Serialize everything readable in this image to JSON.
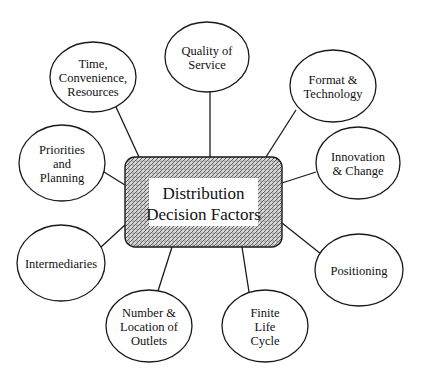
{
  "diagram": {
    "type": "hub-and-spoke",
    "center": {
      "label_lines": [
        "Distribution",
        "Decision Factors"
      ],
      "x": 125,
      "y": 157,
      "width": 157,
      "height": 90,
      "fill_pattern": "stippled-gray"
    },
    "nodes": [
      {
        "id": "time-convenience-resources",
        "label_lines": [
          "Time,",
          "Convenience,",
          "Resources"
        ],
        "cx": 93,
        "cy": 77,
        "rx": 43,
        "ry": 35,
        "line": [
          116,
          107,
          139,
          157
        ]
      },
      {
        "id": "quality-of-service",
        "label_lines": [
          "Quality of",
          "Service"
        ],
        "cx": 207,
        "cy": 57,
        "rx": 42,
        "ry": 35,
        "line": [
          210,
          92,
          210,
          157
        ]
      },
      {
        "id": "format-technology",
        "label_lines": [
          "Format &",
          "Technology"
        ],
        "cx": 333,
        "cy": 86,
        "rx": 43,
        "ry": 36,
        "line": [
          296,
          110,
          266,
          157
        ]
      },
      {
        "id": "innovation-change",
        "label_lines": [
          "Innovation",
          "& Change"
        ],
        "cx": 358,
        "cy": 163,
        "rx": 42,
        "ry": 36,
        "line": [
          316,
          172,
          282,
          183
        ]
      },
      {
        "id": "priorities-planning",
        "label_lines": [
          "Priorities",
          "and",
          "Planning"
        ],
        "cx": 62,
        "cy": 163,
        "rx": 43,
        "ry": 38,
        "line": [
          104,
          172,
          125,
          185
        ]
      },
      {
        "id": "intermediaries",
        "label_lines": [
          "Intermediaries"
        ],
        "cx": 61,
        "cy": 263,
        "rx": 44,
        "ry": 38,
        "line": [
          101,
          247,
          125,
          225
        ]
      },
      {
        "id": "positioning",
        "label_lines": [
          "Positioning"
        ],
        "cx": 359,
        "cy": 270,
        "rx": 44,
        "ry": 36,
        "line": [
          321,
          254,
          282,
          223
        ]
      },
      {
        "id": "number-location-outlets",
        "label_lines": [
          "Number &",
          "Location of",
          "Outlets"
        ],
        "cx": 149,
        "cy": 326,
        "rx": 43,
        "ry": 36,
        "line": [
          158,
          291,
          172,
          247
        ]
      },
      {
        "id": "finite-life-cycle",
        "label_lines": [
          "Finite",
          "Life",
          "Cycle"
        ],
        "cx": 265,
        "cy": 326,
        "rx": 43,
        "ry": 36,
        "line": [
          249,
          292,
          242,
          247
        ]
      }
    ],
    "colors": {
      "stroke": "#1a1a1a",
      "background": "#ffffff",
      "center_pattern_dark": "#5a5a5a",
      "center_pattern_light": "#d8d8d8",
      "text": "#111111"
    }
  }
}
